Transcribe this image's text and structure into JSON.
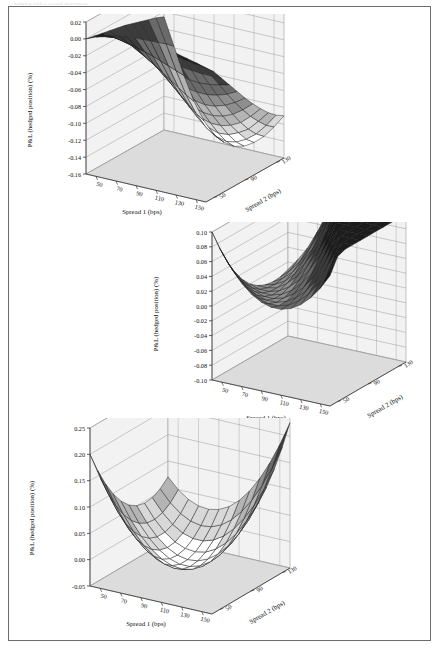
{
  "page": {
    "header_faint_text": "hedging with a second instrument",
    "background": "#ffffff",
    "frame_color": "#6d6d6d"
  },
  "palette": {
    "surface_bands": [
      "#ffffff",
      "#d8d8d8",
      "#b4b4b4",
      "#8e8e8e",
      "#6a6a6a",
      "#3c3c3c",
      "#1c1c1c"
    ],
    "floor": "#dcdcdc",
    "wall": "#f2f2f2",
    "grid_line": "#9a9a9a",
    "mesh_line": "#1a1a1a",
    "axis_line": "#333333",
    "text": "#111111"
  },
  "charts": [
    {
      "id": "chart-top",
      "type": "surface",
      "title": "",
      "xlabel": "Spread 1 (bps)",
      "ylabel": "Spread 2 (bps)",
      "zlabel": "P&L (hedged position) (%)",
      "x_ticks": [
        50,
        70,
        90,
        110,
        130,
        150
      ],
      "y_ticks": [
        50,
        90,
        130
      ],
      "z_ticks": [
        0.02,
        0.0,
        -0.02,
        -0.04,
        -0.06,
        -0.08,
        -0.1,
        -0.12,
        -0.14,
        -0.16
      ],
      "z_tick_labels": [
        "0.02",
        "0.00",
        "-0.02",
        "-0.04",
        "-0.06",
        "-0.08",
        "-0.10",
        "-0.12",
        "-0.14",
        "-0.16"
      ],
      "zlim": [
        -0.16,
        0.02
      ],
      "xlim": [
        40,
        160
      ],
      "ylim": [
        40,
        140
      ],
      "x": [
        40,
        50,
        60,
        70,
        80,
        90,
        100,
        110,
        120,
        130,
        140,
        150,
        160
      ],
      "y": [
        40,
        50,
        60,
        70,
        80,
        90,
        100,
        110,
        120,
        130,
        140
      ],
      "z": [
        [
          0.0,
          -0.002,
          -0.004,
          -0.006,
          -0.008,
          -0.01,
          -0.013,
          -0.016,
          -0.019,
          -0.022,
          -0.026
        ],
        [
          0.005,
          0.001,
          -0.004,
          -0.01,
          -0.016,
          -0.022,
          -0.029,
          -0.036,
          -0.043,
          -0.05,
          -0.058
        ],
        [
          0.008,
          0.002,
          -0.007,
          -0.016,
          -0.026,
          -0.036,
          -0.046,
          -0.057,
          -0.068,
          -0.079,
          -0.09
        ],
        [
          0.01,
          0.002,
          -0.01,
          -0.023,
          -0.036,
          -0.049,
          -0.063,
          -0.077,
          -0.091,
          -0.105,
          -0.118
        ],
        [
          0.012,
          0.002,
          -0.013,
          -0.028,
          -0.044,
          -0.06,
          -0.076,
          -0.092,
          -0.108,
          -0.124,
          -0.138
        ],
        [
          0.013,
          0.001,
          -0.016,
          -0.034,
          -0.052,
          -0.07,
          -0.088,
          -0.105,
          -0.122,
          -0.138,
          -0.152
        ],
        [
          0.013,
          0.0,
          -0.018,
          -0.037,
          -0.057,
          -0.076,
          -0.095,
          -0.113,
          -0.13,
          -0.146,
          -0.158
        ],
        [
          0.012,
          -0.001,
          -0.02,
          -0.04,
          -0.06,
          -0.08,
          -0.099,
          -0.117,
          -0.134,
          -0.149,
          -0.16
        ],
        [
          0.01,
          -0.003,
          -0.022,
          -0.042,
          -0.062,
          -0.082,
          -0.1,
          -0.117,
          -0.133,
          -0.147,
          -0.157
        ],
        [
          0.008,
          -0.005,
          -0.023,
          -0.043,
          -0.062,
          -0.081,
          -0.098,
          -0.114,
          -0.128,
          -0.141,
          -0.15
        ],
        [
          0.005,
          -0.007,
          -0.024,
          -0.042,
          -0.06,
          -0.077,
          -0.093,
          -0.108,
          -0.121,
          -0.132,
          -0.14
        ],
        [
          0.002,
          -0.009,
          -0.024,
          -0.04,
          -0.056,
          -0.071,
          -0.085,
          -0.098,
          -0.109,
          -0.119,
          -0.126
        ],
        [
          -0.001,
          -0.011,
          -0.024,
          -0.037,
          -0.05,
          -0.063,
          -0.075,
          -0.086,
          -0.096,
          -0.104,
          -0.11
        ]
      ]
    },
    {
      "id": "chart-middle",
      "type": "surface",
      "title": "",
      "xlabel": "Spread 1 (bps)",
      "ylabel": "Spread 2 (bps)",
      "zlabel": "P&L (hedged position) (%)",
      "x_ticks": [
        50,
        70,
        90,
        110,
        130,
        150
      ],
      "y_ticks": [
        50,
        90,
        130
      ],
      "z_ticks": [
        0.1,
        0.08,
        0.06,
        0.04,
        0.02,
        0.0,
        -0.02,
        -0.04,
        -0.06,
        -0.08,
        -0.1
      ],
      "z_tick_labels": [
        "0.10",
        "0.08",
        "0.06",
        "0.04",
        "0.02",
        "0.00",
        "-0.02",
        "-0.04",
        "-0.06",
        "-0.08",
        "-0.10"
      ],
      "zlim": [
        -0.1,
        0.1
      ],
      "xlim": [
        40,
        160
      ],
      "ylim": [
        40,
        140
      ],
      "x": [
        40,
        50,
        60,
        70,
        80,
        90,
        100,
        110,
        120,
        130,
        140,
        150,
        160
      ],
      "y": [
        40,
        50,
        60,
        70,
        80,
        90,
        100,
        110,
        120,
        130,
        140
      ],
      "z": [
        [
          0.1,
          0.072,
          0.048,
          0.028,
          0.012,
          0.0,
          -0.008,
          -0.013,
          -0.015,
          -0.014,
          -0.01
        ],
        [
          0.076,
          0.052,
          0.032,
          0.016,
          0.004,
          -0.004,
          -0.008,
          -0.009,
          -0.007,
          -0.002,
          0.006
        ],
        [
          0.056,
          0.036,
          0.02,
          0.008,
          0.0,
          -0.004,
          -0.005,
          -0.002,
          0.004,
          0.013,
          0.025
        ],
        [
          0.04,
          0.024,
          0.012,
          0.004,
          0.0,
          0.0,
          0.004,
          0.011,
          0.021,
          0.034,
          0.05
        ],
        [
          0.028,
          0.016,
          0.008,
          0.004,
          0.004,
          0.008,
          0.016,
          0.027,
          0.041,
          0.058,
          0.078
        ],
        [
          0.02,
          0.012,
          0.008,
          0.008,
          0.012,
          0.02,
          0.032,
          0.047,
          0.065,
          0.086,
          0.11
        ],
        [
          0.016,
          0.012,
          0.012,
          0.016,
          0.024,
          0.036,
          0.052,
          0.071,
          0.093,
          0.118,
          0.146
        ],
        [
          0.016,
          0.016,
          0.02,
          0.028,
          0.04,
          0.056,
          0.076,
          0.099,
          0.125,
          0.154,
          0.186
        ],
        [
          0.02,
          0.024,
          0.032,
          0.044,
          0.06,
          0.08,
          0.104,
          0.131,
          0.161,
          0.194,
          0.23
        ],
        [
          0.028,
          0.036,
          0.048,
          0.064,
          0.084,
          0.108,
          0.136,
          0.167,
          0.201,
          0.238,
          0.278
        ],
        [
          0.04,
          0.052,
          0.068,
          0.088,
          0.112,
          0.14,
          0.172,
          0.207,
          0.245,
          0.286,
          0.33
        ],
        [
          0.056,
          0.072,
          0.092,
          0.116,
          0.144,
          0.176,
          0.212,
          0.251,
          0.293,
          0.338,
          0.386
        ],
        [
          0.076,
          0.096,
          0.12,
          0.148,
          0.18,
          0.216,
          0.256,
          0.299,
          0.345,
          0.394,
          0.446
        ]
      ]
    },
    {
      "id": "chart-bottom",
      "type": "surface",
      "title": "",
      "xlabel": "Spread 1 (bps)",
      "ylabel": "Spread 2 (bps)",
      "zlabel": "P&L (hedged position) (%)",
      "x_ticks": [
        50,
        70,
        90,
        110,
        130,
        150
      ],
      "y_ticks": [
        50,
        90,
        130
      ],
      "z_ticks": [
        0.25,
        0.2,
        0.15,
        0.1,
        0.05,
        0.0,
        -0.05
      ],
      "z_tick_labels": [
        "0.25",
        "0.20",
        "0.15",
        "0.10",
        "0.05",
        "0.00",
        "-0.05"
      ],
      "zlim": [
        -0.05,
        0.25
      ],
      "xlim": [
        40,
        160
      ],
      "ylim": [
        40,
        140
      ],
      "x": [
        40,
        50,
        60,
        70,
        80,
        90,
        100,
        110,
        120,
        130,
        140,
        150,
        160
      ],
      "y": [
        40,
        50,
        60,
        70,
        80,
        90,
        100,
        110,
        120,
        130,
        140
      ],
      "z": [
        [
          0.2,
          0.16,
          0.126,
          0.098,
          0.076,
          0.06,
          0.05,
          0.046,
          0.048,
          0.056,
          0.07
        ],
        [
          0.16,
          0.122,
          0.09,
          0.064,
          0.044,
          0.03,
          0.022,
          0.02,
          0.024,
          0.034,
          0.05
        ],
        [
          0.126,
          0.09,
          0.06,
          0.036,
          0.018,
          0.006,
          0.0,
          0.0,
          0.006,
          0.018,
          0.036
        ],
        [
          0.098,
          0.064,
          0.036,
          0.014,
          -0.002,
          -0.012,
          -0.016,
          -0.014,
          -0.006,
          0.008,
          0.028
        ],
        [
          0.076,
          0.044,
          0.018,
          -0.002,
          -0.016,
          -0.024,
          -0.026,
          -0.022,
          -0.012,
          0.004,
          0.026
        ],
        [
          0.06,
          0.03,
          0.006,
          -0.012,
          -0.024,
          -0.03,
          -0.03,
          -0.024,
          -0.012,
          0.006,
          0.03
        ],
        [
          0.05,
          0.022,
          0.0,
          -0.016,
          -0.026,
          -0.03,
          -0.028,
          -0.02,
          -0.006,
          0.014,
          0.04
        ],
        [
          0.046,
          0.02,
          0.0,
          -0.014,
          -0.022,
          -0.024,
          -0.02,
          -0.01,
          0.006,
          0.028,
          0.056
        ],
        [
          0.048,
          0.024,
          0.006,
          -0.006,
          -0.012,
          -0.012,
          -0.006,
          0.006,
          0.024,
          0.048,
          0.078
        ],
        [
          0.056,
          0.034,
          0.018,
          0.008,
          0.004,
          0.006,
          0.014,
          0.028,
          0.048,
          0.074,
          0.106
        ],
        [
          0.07,
          0.05,
          0.036,
          0.028,
          0.026,
          0.03,
          0.04,
          0.056,
          0.078,
          0.106,
          0.14
        ],
        [
          0.09,
          0.072,
          0.06,
          0.054,
          0.054,
          0.06,
          0.072,
          0.09,
          0.114,
          0.144,
          0.18
        ],
        [
          0.116,
          0.1,
          0.09,
          0.086,
          0.088,
          0.096,
          0.11,
          0.13,
          0.156,
          0.188,
          0.226
        ]
      ]
    }
  ]
}
